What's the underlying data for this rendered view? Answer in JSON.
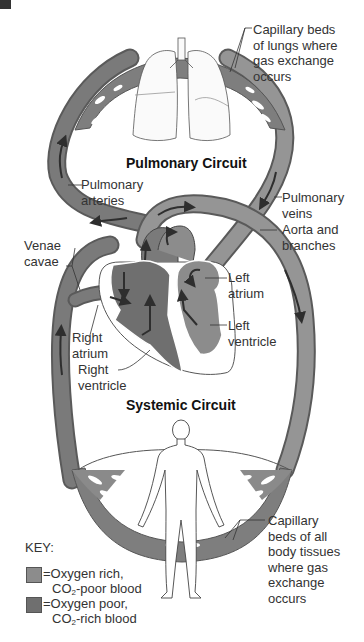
{
  "titles": {
    "pulmonary": "Pulmonary Circuit",
    "systemic": "Systemic Circuit"
  },
  "labels": {
    "lung_capillaries": [
      "Capillary beds",
      "of lungs where",
      "gas exchange",
      "occurs"
    ],
    "pulmonary_arteries": [
      "Pulmonary",
      "arteries"
    ],
    "pulmonary_veins": [
      "Pulmonary",
      "veins"
    ],
    "aorta": [
      "Aorta and",
      "branches"
    ],
    "venae_cavae": [
      "Venae",
      "cavae"
    ],
    "left_atrium": [
      "Left",
      "atrium"
    ],
    "left_ventricle": [
      "Left",
      "ventricle"
    ],
    "right_atrium": [
      "Right",
      "atrium"
    ],
    "right_ventricle": [
      "Right",
      "ventricle"
    ],
    "body_capillaries": [
      "Capillary",
      "beds of all",
      "body tissues",
      "where gas",
      "exchange",
      "occurs"
    ]
  },
  "key": {
    "title": "KEY:",
    "items": [
      {
        "line1": "=Oxygen rich,",
        "line2_pre": "CO",
        "line2_sub": "2",
        "line2_post": "-poor blood",
        "color": "#8c8c8c"
      },
      {
        "line1": "=Oxygen poor,",
        "line2_pre": "CO",
        "line2_sub": "2",
        "line2_post": "-rich blood",
        "color": "#6f6f6f"
      }
    ]
  },
  "colors": {
    "oxygen_rich": "#8c8c8c",
    "oxygen_poor": "#6f6f6f",
    "vessel_outline": "#5a5a5a",
    "arrow": "#2e2e2e"
  }
}
